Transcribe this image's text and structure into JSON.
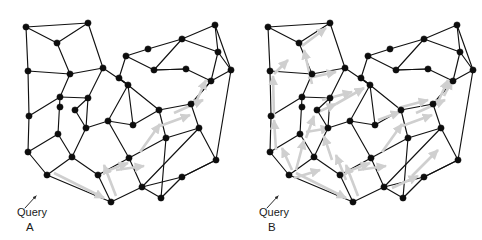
{
  "figure": {
    "width": 482,
    "height": 240,
    "background": "#ffffff",
    "node_color": "#0d0d0d",
    "edge_color": "#111111",
    "arrow_color": "#cfcfcf",
    "pointer_color": "#2a2a2a",
    "text_color": "#1a1a1a"
  },
  "panels": [
    {
      "id": "A",
      "label": "A",
      "query_label": "Query",
      "label_x": 26,
      "label_y": 231,
      "query_x": 17,
      "query_y": 216,
      "pointer": {
        "x1": 25,
        "y1": 208,
        "x2": 36,
        "y2": 196
      },
      "offset_x": 0,
      "nodes": [
        {
          "id": 0,
          "x": 26,
          "y": 27
        },
        {
          "id": 1,
          "x": 57,
          "y": 43
        },
        {
          "id": 2,
          "x": 88,
          "y": 23
        },
        {
          "id": 3,
          "x": 28,
          "y": 71
        },
        {
          "id": 4,
          "x": 70,
          "y": 74
        },
        {
          "id": 5,
          "x": 103,
          "y": 68
        },
        {
          "id": 6,
          "x": 29,
          "y": 116
        },
        {
          "id": 7,
          "x": 60,
          "y": 97
        },
        {
          "id": 8,
          "x": 88,
          "y": 98
        },
        {
          "id": 9,
          "x": 128,
          "y": 85
        },
        {
          "id": 10,
          "x": 60,
          "y": 107
        },
        {
          "id": 11,
          "x": 75,
          "y": 110
        },
        {
          "id": 12,
          "x": 28,
          "y": 152
        },
        {
          "id": 13,
          "x": 58,
          "y": 134
        },
        {
          "id": 14,
          "x": 86,
          "y": 128
        },
        {
          "id": 15,
          "x": 108,
          "y": 121
        },
        {
          "id": 16,
          "x": 47,
          "y": 175
        },
        {
          "id": 17,
          "x": 72,
          "y": 157
        },
        {
          "id": 18,
          "x": 98,
          "y": 175
        },
        {
          "id": 19,
          "x": 129,
          "y": 158
        },
        {
          "id": 20,
          "x": 111,
          "y": 202
        },
        {
          "id": 21,
          "x": 142,
          "y": 187
        },
        {
          "id": 22,
          "x": 148,
          "y": 49
        },
        {
          "id": 23,
          "x": 126,
          "y": 56
        },
        {
          "id": 24,
          "x": 119,
          "y": 78
        },
        {
          "id": 25,
          "x": 154,
          "y": 70
        },
        {
          "id": 26,
          "x": 182,
          "y": 39
        },
        {
          "id": 27,
          "x": 215,
          "y": 25
        },
        {
          "id": 28,
          "x": 218,
          "y": 52
        },
        {
          "id": 29,
          "x": 231,
          "y": 70
        },
        {
          "id": 30,
          "x": 211,
          "y": 81
        },
        {
          "id": 31,
          "x": 186,
          "y": 69
        },
        {
          "id": 32,
          "x": 159,
          "y": 110
        },
        {
          "id": 33,
          "x": 191,
          "y": 104
        },
        {
          "id": 34,
          "x": 166,
          "y": 138
        },
        {
          "id": 35,
          "x": 199,
          "y": 128
        },
        {
          "id": 36,
          "x": 216,
          "y": 160
        },
        {
          "id": 37,
          "x": 182,
          "y": 177
        },
        {
          "id": 38,
          "x": 161,
          "y": 198
        },
        {
          "id": 39,
          "x": 133,
          "y": 125
        }
      ],
      "edges": [
        [
          0,
          1
        ],
        [
          0,
          2
        ],
        [
          0,
          3
        ],
        [
          1,
          2
        ],
        [
          1,
          4
        ],
        [
          2,
          5
        ],
        [
          3,
          4
        ],
        [
          3,
          6
        ],
        [
          4,
          7
        ],
        [
          4,
          5
        ],
        [
          5,
          9
        ],
        [
          5,
          8
        ],
        [
          6,
          7
        ],
        [
          6,
          12
        ],
        [
          7,
          8
        ],
        [
          7,
          13
        ],
        [
          8,
          11
        ],
        [
          8,
          14
        ],
        [
          9,
          24
        ],
        [
          9,
          39
        ],
        [
          9,
          15
        ],
        [
          11,
          14
        ],
        [
          12,
          13
        ],
        [
          12,
          16
        ],
        [
          13,
          17
        ],
        [
          14,
          15
        ],
        [
          14,
          17
        ],
        [
          15,
          39
        ],
        [
          15,
          19
        ],
        [
          16,
          17
        ],
        [
          16,
          20
        ],
        [
          17,
          18
        ],
        [
          18,
          19
        ],
        [
          18,
          20
        ],
        [
          19,
          21
        ],
        [
          19,
          34
        ],
        [
          20,
          21
        ],
        [
          21,
          38
        ],
        [
          22,
          23
        ],
        [
          22,
          26
        ],
        [
          23,
          24
        ],
        [
          23,
          25
        ],
        [
          24,
          9
        ],
        [
          25,
          26
        ],
        [
          25,
          31
        ],
        [
          26,
          27
        ],
        [
          26,
          28
        ],
        [
          27,
          28
        ],
        [
          27,
          29
        ],
        [
          28,
          29
        ],
        [
          28,
          30
        ],
        [
          29,
          30
        ],
        [
          30,
          31
        ],
        [
          30,
          33
        ],
        [
          31,
          25
        ],
        [
          32,
          33
        ],
        [
          32,
          34
        ],
        [
          32,
          39
        ],
        [
          33,
          35
        ],
        [
          33,
          30
        ],
        [
          34,
          35
        ],
        [
          34,
          38
        ],
        [
          35,
          36
        ],
        [
          36,
          37
        ],
        [
          37,
          38
        ],
        [
          37,
          36
        ],
        [
          32,
          9
        ],
        [
          36,
          29
        ],
        [
          35,
          21
        ],
        [
          21,
          37
        ]
      ],
      "arrows": [
        {
          "x1": 54,
          "y1": 173,
          "x2": 104,
          "y2": 198
        },
        {
          "x1": 116,
          "y1": 196,
          "x2": 104,
          "y2": 165
        },
        {
          "x1": 104,
          "y1": 172,
          "x2": 128,
          "y2": 163
        },
        {
          "x1": 116,
          "y1": 170,
          "x2": 144,
          "y2": 166
        },
        {
          "x1": 140,
          "y1": 152,
          "x2": 160,
          "y2": 124
        },
        {
          "x1": 160,
          "y1": 126,
          "x2": 190,
          "y2": 115
        },
        {
          "x1": 174,
          "y1": 113,
          "x2": 203,
          "y2": 100
        },
        {
          "x1": 196,
          "y1": 102,
          "x2": 206,
          "y2": 80
        }
      ]
    },
    {
      "id": "B",
      "label": "B",
      "query_label": "Query",
      "label_x": 268,
      "label_y": 231,
      "query_x": 259,
      "query_y": 216,
      "pointer": {
        "x1": 267,
        "y1": 208,
        "x2": 278,
        "y2": 196
      },
      "offset_x": 242,
      "nodes": [
        {
          "id": 0,
          "x": 26,
          "y": 27
        },
        {
          "id": 1,
          "x": 57,
          "y": 43
        },
        {
          "id": 2,
          "x": 88,
          "y": 23
        },
        {
          "id": 3,
          "x": 28,
          "y": 71
        },
        {
          "id": 4,
          "x": 70,
          "y": 74
        },
        {
          "id": 5,
          "x": 103,
          "y": 68
        },
        {
          "id": 6,
          "x": 29,
          "y": 116
        },
        {
          "id": 7,
          "x": 60,
          "y": 97
        },
        {
          "id": 8,
          "x": 88,
          "y": 98
        },
        {
          "id": 9,
          "x": 128,
          "y": 85
        },
        {
          "id": 10,
          "x": 60,
          "y": 107
        },
        {
          "id": 11,
          "x": 75,
          "y": 110
        },
        {
          "id": 12,
          "x": 28,
          "y": 152
        },
        {
          "id": 13,
          "x": 58,
          "y": 134
        },
        {
          "id": 14,
          "x": 86,
          "y": 128
        },
        {
          "id": 15,
          "x": 108,
          "y": 121
        },
        {
          "id": 16,
          "x": 47,
          "y": 175
        },
        {
          "id": 17,
          "x": 72,
          "y": 157
        },
        {
          "id": 18,
          "x": 98,
          "y": 175
        },
        {
          "id": 19,
          "x": 129,
          "y": 158
        },
        {
          "id": 20,
          "x": 111,
          "y": 202
        },
        {
          "id": 21,
          "x": 142,
          "y": 187
        },
        {
          "id": 22,
          "x": 148,
          "y": 49
        },
        {
          "id": 23,
          "x": 126,
          "y": 56
        },
        {
          "id": 24,
          "x": 119,
          "y": 78
        },
        {
          "id": 25,
          "x": 154,
          "y": 70
        },
        {
          "id": 26,
          "x": 182,
          "y": 39
        },
        {
          "id": 27,
          "x": 215,
          "y": 25
        },
        {
          "id": 28,
          "x": 218,
          "y": 52
        },
        {
          "id": 29,
          "x": 231,
          "y": 70
        },
        {
          "id": 30,
          "x": 211,
          "y": 81
        },
        {
          "id": 31,
          "x": 186,
          "y": 69
        },
        {
          "id": 32,
          "x": 159,
          "y": 110
        },
        {
          "id": 33,
          "x": 191,
          "y": 104
        },
        {
          "id": 34,
          "x": 166,
          "y": 138
        },
        {
          "id": 35,
          "x": 199,
          "y": 128
        },
        {
          "id": 36,
          "x": 216,
          "y": 160
        },
        {
          "id": 37,
          "x": 182,
          "y": 177
        },
        {
          "id": 38,
          "x": 161,
          "y": 198
        },
        {
          "id": 39,
          "x": 133,
          "y": 125
        }
      ],
      "edges": [
        [
          0,
          1
        ],
        [
          0,
          2
        ],
        [
          0,
          3
        ],
        [
          1,
          2
        ],
        [
          1,
          4
        ],
        [
          2,
          5
        ],
        [
          3,
          4
        ],
        [
          3,
          6
        ],
        [
          4,
          7
        ],
        [
          4,
          5
        ],
        [
          5,
          9
        ],
        [
          5,
          8
        ],
        [
          6,
          7
        ],
        [
          6,
          12
        ],
        [
          7,
          8
        ],
        [
          7,
          13
        ],
        [
          8,
          11
        ],
        [
          8,
          14
        ],
        [
          9,
          24
        ],
        [
          9,
          39
        ],
        [
          9,
          15
        ],
        [
          11,
          14
        ],
        [
          12,
          13
        ],
        [
          12,
          16
        ],
        [
          13,
          17
        ],
        [
          14,
          15
        ],
        [
          14,
          17
        ],
        [
          15,
          39
        ],
        [
          15,
          19
        ],
        [
          16,
          17
        ],
        [
          16,
          20
        ],
        [
          17,
          18
        ],
        [
          18,
          19
        ],
        [
          18,
          20
        ],
        [
          19,
          21
        ],
        [
          19,
          34
        ],
        [
          20,
          21
        ],
        [
          21,
          38
        ],
        [
          22,
          23
        ],
        [
          22,
          26
        ],
        [
          23,
          24
        ],
        [
          23,
          25
        ],
        [
          24,
          9
        ],
        [
          25,
          26
        ],
        [
          25,
          31
        ],
        [
          26,
          27
        ],
        [
          26,
          28
        ],
        [
          27,
          28
        ],
        [
          27,
          29
        ],
        [
          28,
          29
        ],
        [
          28,
          30
        ],
        [
          29,
          30
        ],
        [
          30,
          31
        ],
        [
          30,
          33
        ],
        [
          31,
          25
        ],
        [
          32,
          33
        ],
        [
          32,
          34
        ],
        [
          32,
          39
        ],
        [
          33,
          35
        ],
        [
          33,
          30
        ],
        [
          34,
          35
        ],
        [
          34,
          38
        ],
        [
          35,
          36
        ],
        [
          36,
          37
        ],
        [
          37,
          38
        ],
        [
          37,
          36
        ],
        [
          32,
          9
        ],
        [
          36,
          29
        ],
        [
          35,
          21
        ],
        [
          21,
          37
        ]
      ],
      "arrows": [
        {
          "x1": 54,
          "y1": 173,
          "x2": 104,
          "y2": 198
        },
        {
          "x1": 52,
          "y1": 178,
          "x2": 78,
          "y2": 170
        },
        {
          "x1": 50,
          "y1": 170,
          "x2": 40,
          "y2": 148
        },
        {
          "x1": 34,
          "y1": 150,
          "x2": 32,
          "y2": 120
        },
        {
          "x1": 32,
          "y1": 118,
          "x2": 31,
          "y2": 76
        },
        {
          "x1": 32,
          "y1": 74,
          "x2": 46,
          "y2": 60
        },
        {
          "x1": 54,
          "y1": 170,
          "x2": 62,
          "y2": 140
        },
        {
          "x1": 64,
          "y1": 138,
          "x2": 72,
          "y2": 116
        },
        {
          "x1": 64,
          "y1": 132,
          "x2": 88,
          "y2": 128
        },
        {
          "x1": 76,
          "y1": 112,
          "x2": 94,
          "y2": 104
        },
        {
          "x1": 70,
          "y1": 84,
          "x2": 62,
          "y2": 50
        },
        {
          "x1": 66,
          "y1": 78,
          "x2": 94,
          "y2": 72
        },
        {
          "x1": 60,
          "y1": 46,
          "x2": 84,
          "y2": 28
        },
        {
          "x1": 80,
          "y1": 100,
          "x2": 110,
          "y2": 92
        },
        {
          "x1": 94,
          "y1": 104,
          "x2": 122,
          "y2": 88
        },
        {
          "x1": 116,
          "y1": 196,
          "x2": 104,
          "y2": 165
        },
        {
          "x1": 104,
          "y1": 172,
          "x2": 128,
          "y2": 163
        },
        {
          "x1": 116,
          "y1": 170,
          "x2": 144,
          "y2": 166
        },
        {
          "x1": 104,
          "y1": 180,
          "x2": 94,
          "y2": 155
        },
        {
          "x1": 90,
          "y1": 160,
          "x2": 82,
          "y2": 136
        },
        {
          "x1": 140,
          "y1": 152,
          "x2": 160,
          "y2": 124
        },
        {
          "x1": 160,
          "y1": 126,
          "x2": 190,
          "y2": 115
        },
        {
          "x1": 174,
          "y1": 113,
          "x2": 203,
          "y2": 100
        },
        {
          "x1": 196,
          "y1": 102,
          "x2": 206,
          "y2": 80
        },
        {
          "x1": 150,
          "y1": 188,
          "x2": 176,
          "y2": 176
        },
        {
          "x1": 170,
          "y1": 176,
          "x2": 196,
          "y2": 150
        },
        {
          "x1": 136,
          "y1": 120,
          "x2": 158,
          "y2": 112
        },
        {
          "x1": 156,
          "y1": 108,
          "x2": 186,
          "y2": 100
        },
        {
          "x1": 202,
          "y1": 96,
          "x2": 210,
          "y2": 80
        }
      ]
    }
  ]
}
